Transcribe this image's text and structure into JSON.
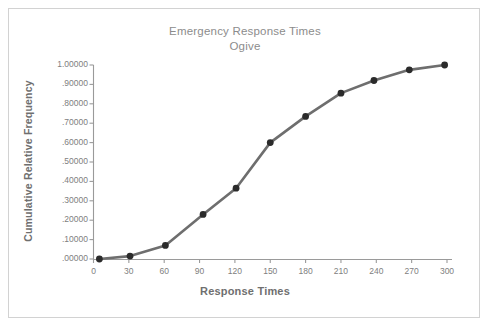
{
  "figure": {
    "background_color": "#ffffff",
    "border_color": "#d2d2d2",
    "title_color": "#8c8c8c",
    "axis_color": "#9a9a9a",
    "line_color": "#6e6e6e",
    "marker_color": "#2b2b2b",
    "tick_label_color": "#808080",
    "axis_label_color": "#6f6f6f"
  },
  "chart_data": {
    "type": "line",
    "title": "Emergency Response Times",
    "subtitle": "Ogive",
    "xlabel": "Response Times",
    "ylabel": "Cumulative Relative Frequency",
    "xlim": [
      0,
      300
    ],
    "ylim": [
      0.0,
      1.0
    ],
    "grid": false,
    "legend": null,
    "xticks": [
      0,
      30,
      60,
      90,
      120,
      150,
      180,
      210,
      240,
      270,
      300
    ],
    "xtick_labels": [
      "0",
      "30",
      "60",
      "90",
      "120",
      "150",
      "180",
      "210",
      "240",
      "270",
      "300"
    ],
    "yticks": [
      0.0,
      0.1,
      0.2,
      0.3,
      0.4,
      0.5,
      0.6,
      0.7,
      0.8,
      0.9,
      1.0
    ],
    "ytick_labels": [
      ".00000",
      ".10000",
      ".20000",
      ".30000",
      ".40000",
      ".50000",
      ".60000",
      ".70000",
      ".80000",
      ".90000",
      "1.00000"
    ],
    "series": [
      {
        "name": "Cumulative Relative Frequency",
        "marker": "circle",
        "x": [
          5,
          31,
          61,
          93,
          121,
          150,
          180,
          210,
          238,
          268,
          298
        ],
        "values": [
          0.0,
          0.015,
          0.07,
          0.23,
          0.365,
          0.6,
          0.735,
          0.855,
          0.92,
          0.975,
          1.0
        ],
        "point_labels": [
          ".00000",
          ".01500",
          ".07000",
          ".23000",
          ".36500",
          ".60000",
          ".73500",
          ".85500",
          ".92000",
          ".97500",
          "1.00000"
        ]
      }
    ]
  }
}
